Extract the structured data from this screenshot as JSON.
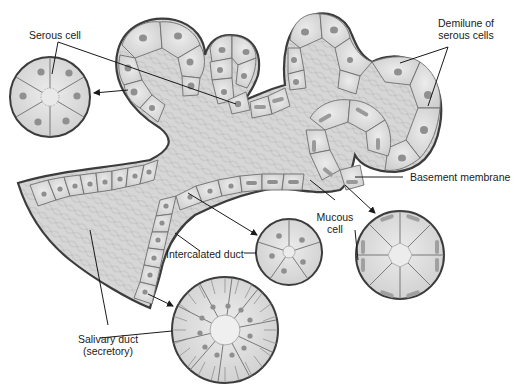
{
  "diagram": {
    "colors": {
      "background": "#ffffff",
      "cell_fill": "#dcdcdc",
      "cell_fill_light": "#e8e8e8",
      "cell_border": "#6e6e6e",
      "basement_membrane": "#3c3c3c",
      "nucleus": "#8f8f8f",
      "mucous_nucleus": "#9a9a9a",
      "lumen_mesh": "#bdbdbd",
      "leader_line": "#1a1a1a"
    },
    "labels": {
      "serous_cell": "Serous cell",
      "demilune_line1": "Demilune of",
      "demilune_line2": "serous cells",
      "basement_membrane": "Basement membrane",
      "mucous_line1": "Mucous",
      "mucous_line2": "cell",
      "intercalated_duct": "Intercalated duct",
      "salivary_duct_line1": "Salivary duct",
      "salivary_duct_line2": "(secretory)"
    },
    "cross_sections": [
      {
        "id": "serous-acinus",
        "label": "Serous cell",
        "cx": 50,
        "cy": 97,
        "r": 40
      },
      {
        "id": "intercalated-duct",
        "label": "Intercalated duct",
        "cx": 289,
        "cy": 252,
        "r": 33
      },
      {
        "id": "mucous-acinus",
        "label": "Mucous cell",
        "cx": 400,
        "cy": 255,
        "r": 44
      },
      {
        "id": "salivary-duct",
        "label": "Salivary duct (secretory)",
        "cx": 225,
        "cy": 330,
        "r": 53
      }
    ]
  }
}
